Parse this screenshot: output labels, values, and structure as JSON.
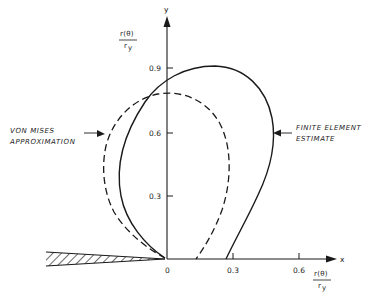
{
  "figure": {
    "y_axis": {
      "name": "y",
      "label_num": "r(θ)",
      "label_den": "r",
      "label_den_sub": "y",
      "ticks": [
        "0.3",
        "0.6",
        "0.9"
      ]
    },
    "x_axis": {
      "name": "x",
      "label_num": "r(θ)",
      "label_den": "r",
      "label_den_sub": "y",
      "ticks": [
        "0",
        "0.3",
        "0.6"
      ]
    },
    "annotations": {
      "von_mises_line1": "VON MISES",
      "von_mises_line2": "APPROXIMATION",
      "fe_line1": "FINITE ELEMENT",
      "fe_line2": "ESTIMATE"
    },
    "curves": [
      {
        "name": "Von Mises approximation",
        "style": "dashed"
      },
      {
        "name": "Finite element estimate",
        "style": "solid"
      }
    ],
    "colors": {
      "ink": "#1a1a1a",
      "background": "#ffffff"
    }
  }
}
